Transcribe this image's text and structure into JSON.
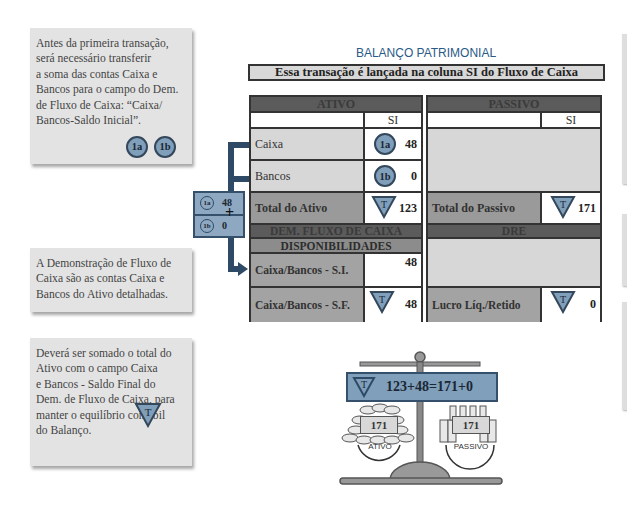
{
  "notes": [
    {
      "text": "Antes da primeira transação,\nserá necessário transferir\na soma das contas Caixa e\nBancos para o campo do Dem.\nde Fluxo de Caixa: “Caixa/\nBancos-Saldo Inicial”.",
      "badges": [
        "1a",
        "1b"
      ]
    },
    {
      "text": "A Demonstração de Fluxo de\nCaixa são as contas Caixa e\nBancos do Ativo detalhadas."
    },
    {
      "text": "Deverá ser somado o total do\nAtivo com o campo Caixa\ne Bancos - Saldo Final do\nDem. de Fluxo de Caixa, para\nmanter o equilíbrio contábil\ndo Balanço.",
      "badge": "T"
    }
  ],
  "header": {
    "title": "BALANÇO PATRIMONIAL",
    "subtitle": "Essa transação é lançada na coluna SI do Fluxo de Caixa"
  },
  "ativo": {
    "title": "ATIVO",
    "col": "SI",
    "rows": [
      {
        "label": "Caixa",
        "badge": "1a",
        "value": "48"
      },
      {
        "label": "Bancos",
        "badge": "1b",
        "value": "0"
      },
      {
        "label": "Total do Ativo",
        "badge": "T",
        "value": "123"
      }
    ]
  },
  "dfc": {
    "title": "DEM. FLUXO DE CAIXA",
    "subtitle": "DISPONIBILIDADES",
    "rows": [
      {
        "label": "Caixa/Bancos - S.I.",
        "value": "48"
      },
      {
        "label": "Caixa/Bancos - S.F.",
        "badge": "T",
        "value": "48"
      }
    ]
  },
  "passivo": {
    "title": "PASSIVO",
    "col": "SI",
    "total": {
      "label": "Total do Passivo",
      "badge": "T",
      "value": "171"
    }
  },
  "dre": {
    "title": "DRE",
    "row": {
      "label": "Lucro Líq./Retido",
      "badge": "T",
      "value": "0"
    }
  },
  "sum_box": {
    "a_badge": "1a",
    "a_value": "48",
    "b_badge": "1b",
    "b_value": "0",
    "operator": "+"
  },
  "scale": {
    "badge": "T",
    "equation": "123+48=171+0",
    "left_value": "171",
    "left_label": "ATIVO",
    "right_value": "171",
    "right_label": "PASSIVO"
  },
  "colors": {
    "accent_blue": "#7f9fbb",
    "dark_blue": "#2e4a66",
    "header_gray": "#5b5b5b",
    "title_blue": "#2a5a86"
  }
}
